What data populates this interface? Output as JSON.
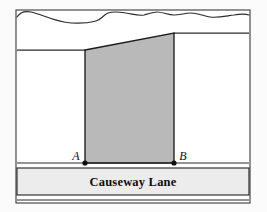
{
  "figure": {
    "kind": "surveying-plot-diagram",
    "caption_text": "",
    "background_color": "#fbfbfb",
    "frame": {
      "name": "outer-frame",
      "x": 16,
      "y": 10,
      "width": 234,
      "height": 193,
      "stroke_color": "#3a3a3a",
      "fill_color": "#ffffff",
      "stroke_width": 1.1
    },
    "colors": {
      "ink": "#111111",
      "line": "#2b2b2b",
      "shaded_region_fill": "#b9b9b9",
      "road_fill": "#ececec",
      "frame_stroke": "#3a3a3a",
      "paper": "#ffffff"
    },
    "top_boundary": {
      "name": "wavy-terrain-boundary",
      "description": "irregular hand-drawn wavy line across the top of the plot",
      "path": "M 17 17 C 20 12 26 11 31 12 C 40 14 52 20 64 22 C 76 24 88 23 96 21 C 101 20 103 15 108 13 C 114 11 120 12 126 13 C 133 14 138 16 144 15 C 149 14 152 12 157 12 C 163 12 168 15 174 15 C 180 15 185 13 191 13 C 198 13 203 16 210 17 C 218 18 226 16 234 15 C 240 14 246 14 249 15"
    },
    "left_ground_line": {
      "name": "left-ground-line",
      "x1": 17,
      "y1": 50,
      "x2": 85,
      "y2": 50
    },
    "right_ground_line": {
      "name": "right-ground-line",
      "x1": 174,
      "y1": 33,
      "x2": 249,
      "y2": 33
    },
    "shaded_region": {
      "name": "shaded-plot-region",
      "description": "gray shaded quadrilateral bounded by the two vertical lines, the sloping top edge and the roadside baseline",
      "points": "85,50 174,33 174,163 85,163",
      "fill": "#b9b9b9",
      "stroke": "#1c1c1c",
      "stroke_width": 1.3
    },
    "points": [
      {
        "name": "point-a",
        "label": "A",
        "x": 85,
        "y": 163,
        "label_x": 76,
        "label_y": 160,
        "dot_radius": 2.6
      },
      {
        "name": "point-b",
        "label": "B",
        "x": 174,
        "y": 163,
        "label_x": 179,
        "label_y": 160,
        "dot_radius": 2.6
      }
    ],
    "roadside_line": {
      "name": "roadside-kerb-line",
      "x1": 17,
      "y1": 163,
      "x2": 249,
      "y2": 163
    },
    "road": {
      "name": "causeway-lane-road-band",
      "label": "Causeway Lane",
      "label_x": 133,
      "label_y": 186,
      "top_edge_y": 168,
      "bottom_edge_y": 195,
      "lower_edge_y": 200,
      "left_x": 17,
      "right_x": 249,
      "fill": "#ececec"
    }
  }
}
